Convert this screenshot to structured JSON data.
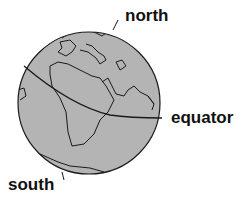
{
  "diagram": {
    "labels": {
      "north": "north",
      "south": "south",
      "equator": "equator"
    },
    "colors": {
      "globe_fill": "#b4b4b4",
      "outline": "#1a1a1a",
      "text": "#111111"
    }
  }
}
